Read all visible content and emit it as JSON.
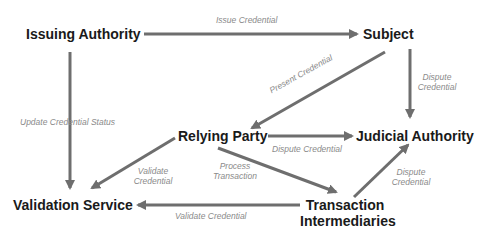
{
  "diagram": {
    "type": "flow-diagram",
    "colors": {
      "node_text": "#1a1a1a",
      "edge": "#6e6e6e",
      "edge_label": "#8a8a8a",
      "background": "#ffffff"
    },
    "nodes": {
      "issuing_authority": "Issuing Authority",
      "subject": "Subject",
      "relying_party": "Relying Party",
      "judicial_authority": "Judicial Authority",
      "validation_service": "Validation Service",
      "transaction_intermediaries_line1": "Transaction",
      "transaction_intermediaries_line2": "Intermediaries"
    },
    "edges": [
      {
        "from": "Issuing Authority",
        "to": "Subject",
        "label": "Issue Credential"
      },
      {
        "from": "Subject",
        "to": "Relying Party",
        "label": "Present Credential"
      },
      {
        "from": "Subject",
        "to": "Judicial Authority",
        "label": "Dispute Credential"
      },
      {
        "from": "Issuing Authority",
        "to": "Validation Service",
        "label": "Update Credential Status"
      },
      {
        "from": "Relying Party",
        "to": "Judicial Authority",
        "label": "Dispute Credential"
      },
      {
        "from": "Relying Party",
        "to": "Validation Service",
        "label": "Validate Credential"
      },
      {
        "from": "Relying Party",
        "to": "Transaction Intermediaries",
        "label": "Process Transaction"
      },
      {
        "from": "Transaction Intermediaries",
        "to": "Judicial Authority",
        "label": "Dispute Credential"
      },
      {
        "from": "Transaction Intermediaries",
        "to": "Validation Service",
        "label": "Validate Credential"
      }
    ],
    "edge_labels": {
      "issue_credential": "Issue Credential",
      "present_credential": "Present Credential",
      "subject_dispute_line1": "Dispute",
      "subject_dispute_line2": "Credential",
      "update_status": "Update Credential Status",
      "rp_dispute": "Dispute Credential",
      "rp_validate_line1": "Validate",
      "rp_validate_line2": "Credential",
      "process_line1": "Process",
      "process_line2": "Transaction",
      "ti_dispute_line1": "Dispute",
      "ti_dispute_line2": "Credential",
      "ti_validate": "Validate Credential"
    }
  }
}
